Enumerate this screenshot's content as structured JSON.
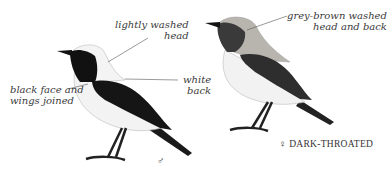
{
  "illustration": {
    "male": {
      "symbol": "♂",
      "annotations": {
        "head": [
          "lightly washed",
          "head"
        ],
        "back": [
          "white",
          "back"
        ],
        "face": [
          "black face and",
          "wings joined"
        ]
      }
    },
    "female": {
      "symbol": "♀",
      "caption": "DARK-THROATED",
      "annotations": {
        "head_back": [
          "grey-brown washed",
          "head and back"
        ]
      }
    }
  }
}
